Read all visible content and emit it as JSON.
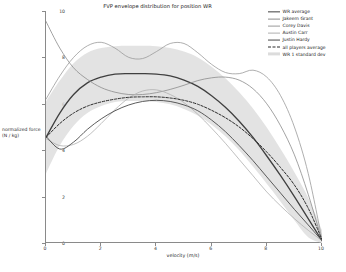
{
  "chart_data": {
    "type": "line",
    "title": "FVP envelope distribution for position WR",
    "xlabel": "velocity (m/s)",
    "ylabel": "normalized force (N / kg)",
    "xlim": [
      0,
      10
    ],
    "ylim": [
      0,
      10
    ],
    "xticks": [
      "0",
      "2",
      "4",
      "6",
      "8",
      "10"
    ],
    "xtick_values": [
      0,
      2,
      4,
      6,
      8,
      10
    ],
    "yticks": [
      "0",
      "2",
      "4",
      "6",
      "8",
      "10"
    ],
    "ytick_values": [
      0,
      2,
      4,
      6,
      8,
      10
    ],
    "grid": false,
    "legend_position": "upper right",
    "x": [
      0,
      0.5,
      1,
      1.5,
      2,
      2.5,
      3,
      3.5,
      4,
      4.5,
      5,
      5.5,
      6,
      6.5,
      7,
      7.5,
      8,
      8.5,
      9,
      9.5,
      10
    ],
    "series": [
      {
        "name": "WR average",
        "color": "#3f3f3f",
        "style": "solid",
        "width": 1.3,
        "values": [
          4.55,
          5.6,
          6.4,
          6.9,
          7.15,
          7.28,
          7.3,
          7.3,
          7.28,
          7.2,
          7.02,
          6.75,
          6.35,
          5.85,
          5.25,
          4.55,
          3.75,
          2.9,
          2.0,
          1.05,
          0.1
        ]
      },
      {
        "name": "Jakeem Grant",
        "color": "#8c8c8c",
        "style": "solid",
        "width": 0.8,
        "values": [
          9.55,
          8.4,
          7.55,
          7.05,
          6.7,
          6.5,
          6.4,
          6.4,
          6.48,
          6.62,
          6.8,
          7.0,
          7.12,
          7.15,
          7.02,
          6.65,
          6.0,
          5.05,
          3.8,
          2.1,
          0.1
        ]
      },
      {
        "name": "Corey Davis",
        "color": "#9a9a9a",
        "style": "solid",
        "width": 0.8,
        "values": [
          6.2,
          7.2,
          8.0,
          8.5,
          8.65,
          8.4,
          8.0,
          7.95,
          8.25,
          8.6,
          8.6,
          8.2,
          7.7,
          7.35,
          7.3,
          7.45,
          7.15,
          6.35,
          5.0,
          3.0,
          0.15
        ]
      },
      {
        "name": "Austin Carr",
        "color": "#b0b0b0",
        "style": "solid",
        "width": 0.8,
        "values": [
          4.5,
          4.2,
          4.25,
          4.6,
          5.15,
          5.75,
          6.25,
          6.55,
          6.6,
          6.4,
          6.05,
          5.55,
          4.95,
          4.3,
          3.6,
          2.9,
          2.2,
          1.6,
          1.05,
          0.55,
          0.1
        ]
      },
      {
        "name": "Justin Hardy",
        "color": "#4a4a4a",
        "style": "solid",
        "width": 0.9,
        "values": [
          4.6,
          4.05,
          4.35,
          4.9,
          5.35,
          5.7,
          5.95,
          6.1,
          6.15,
          6.1,
          5.95,
          5.7,
          5.3,
          4.8,
          4.2,
          3.55,
          2.85,
          2.15,
          1.45,
          0.78,
          0.1
        ]
      },
      {
        "name": "all players average",
        "color": "#2b2b2b",
        "style": "dashed",
        "width": 1.0,
        "values": [
          4.55,
          5.15,
          5.6,
          5.9,
          6.08,
          6.2,
          6.28,
          6.3,
          6.3,
          6.25,
          6.15,
          5.98,
          5.72,
          5.4,
          5.0,
          4.5,
          3.92,
          3.25,
          2.5,
          1.5,
          0.15
        ]
      }
    ],
    "band": {
      "name": "WR 1 standard dev",
      "color": "#d9d9d9",
      "upper": [
        6.1,
        7.0,
        7.75,
        8.2,
        8.4,
        8.48,
        8.5,
        8.5,
        8.48,
        8.4,
        8.25,
        8.0,
        7.6,
        7.1,
        6.5,
        5.8,
        4.98,
        4.05,
        3.05,
        1.95,
        0.55
      ],
      "lower": [
        3.0,
        4.2,
        5.05,
        5.6,
        5.9,
        6.08,
        6.12,
        6.12,
        6.08,
        5.98,
        5.78,
        5.5,
        5.1,
        4.6,
        4.0,
        3.3,
        2.55,
        1.78,
        0.98,
        0.25,
        0.0
      ]
    },
    "legend_entries": [
      {
        "label": "WR average",
        "color": "#3f3f3f",
        "style": "solid",
        "width": 1.3
      },
      {
        "label": "Jakeem Grant",
        "color": "#8c8c8c",
        "style": "solid",
        "width": 0.8
      },
      {
        "label": "Corey Davis",
        "color": "#9a9a9a",
        "style": "solid",
        "width": 0.8
      },
      {
        "label": "Austin Carr",
        "color": "#b0b0b0",
        "style": "solid",
        "width": 0.8
      },
      {
        "label": "Justin Hardy",
        "color": "#4a4a4a",
        "style": "solid",
        "width": 0.9
      },
      {
        "label": "all players average",
        "color": "#2b2b2b",
        "style": "dashed",
        "width": 1.0
      },
      {
        "label": "WR 1 standard dev",
        "color": "#dcdcdc",
        "style": "band",
        "width": 4
      }
    ]
  }
}
